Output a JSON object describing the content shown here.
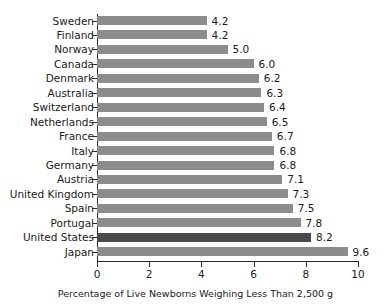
{
  "chart_data": {
    "type": "bar",
    "orientation": "horizontal",
    "title": "",
    "xlabel": "Percentage of Live Newborns Weighing Less Than 2,500 g",
    "ylabel": "",
    "xlim": [
      0,
      10
    ],
    "xticks": [
      0,
      2,
      4,
      6,
      8,
      10
    ],
    "xtick_labels": [
      "0",
      "2",
      "4",
      "6",
      "8",
      "10"
    ],
    "grid": false,
    "legend": null,
    "categories": [
      "Sweden",
      "Finland",
      "Norway",
      "Canada",
      "Denmark",
      "Australia",
      "Switzerland",
      "Netherlands",
      "France",
      "Italy",
      "Germany",
      "Austria",
      "United Kingdom",
      "Spain",
      "Portugal",
      "United States",
      "Japan"
    ],
    "values": [
      4.2,
      4.2,
      5.0,
      6.0,
      6.2,
      6.3,
      6.4,
      6.5,
      6.7,
      6.8,
      6.8,
      7.1,
      7.3,
      7.5,
      7.8,
      8.2,
      9.6
    ],
    "value_labels": [
      "4.2",
      "4.2",
      "5.0",
      "6.0",
      "6.2",
      "6.3",
      "6.4",
      "6.5",
      "6.7",
      "6.8",
      "6.8",
      "7.1",
      "7.3",
      "7.5",
      "7.8",
      "8.2",
      "9.6"
    ],
    "highlight_category": "United States",
    "colors": {
      "bar": "#8c8c8c",
      "bar_highlight": "#4a4a4a",
      "axis": "#2b2b2b",
      "text": "#1a1a1a",
      "background": "#ffffff"
    }
  }
}
